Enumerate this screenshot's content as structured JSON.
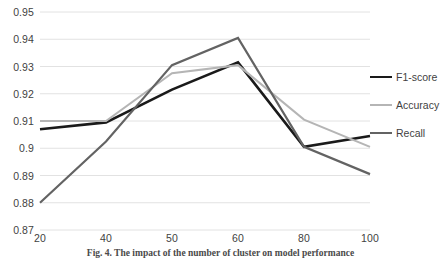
{
  "chart_data": {
    "type": "line",
    "title": "",
    "xlabel": "",
    "ylabel": "",
    "categories": [
      "20",
      "40",
      "50",
      "60",
      "80",
      "100"
    ],
    "ylim": [
      0.87,
      0.95
    ],
    "y_ticks": [
      "0.95",
      "0.94",
      "0.93",
      "0.92",
      "0.91",
      "0.9",
      "0.89",
      "0.88",
      "0.87"
    ],
    "y_tick_values": [
      0.95,
      0.94,
      0.93,
      0.92,
      0.91,
      0.9,
      0.89,
      0.88,
      0.87
    ],
    "grid": true,
    "legend_position": "right",
    "series": [
      {
        "name": "F1-score",
        "color": "#1a1a1a",
        "width": 2.6,
        "values": [
          0.907,
          0.9095,
          0.9215,
          0.9315,
          0.9005,
          0.9045
        ]
      },
      {
        "name": "Accuracy",
        "color": "#b5b5b5",
        "width": 2.0,
        "values": [
          0.91,
          0.91,
          0.9275,
          0.9305,
          0.9105,
          0.9005
        ]
      },
      {
        "name": "Recall",
        "color": "#636363",
        "width": 2.2,
        "values": [
          0.88,
          0.9025,
          0.9305,
          0.9405,
          0.9005,
          0.8905
        ]
      }
    ]
  },
  "legend": {
    "entries": [
      {
        "label": "F1-score"
      },
      {
        "label": "Accuracy"
      },
      {
        "label": "Recall"
      }
    ]
  },
  "caption": {
    "text": "Fig. 4.  The impact of the number of cluster on model performance"
  }
}
